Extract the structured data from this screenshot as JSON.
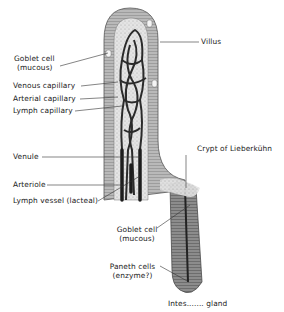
{
  "diagram": {
    "labels": {
      "villus": "Villus",
      "goblet_cell_villus": "Goblet cell",
      "goblet_cell_villus_note": "(mucous)",
      "venous_capillary": "Venous capillary",
      "arterial_capillary": "Arterial capillary",
      "lymph_capillary": "Lymph capillary",
      "venule": "Venule",
      "arteriole": "Arteriole",
      "lymph_vessel": "Lymph vessel (lacteal)",
      "crypt": "Crypt of Lieberkühn",
      "goblet_cell_crypt": "Goblet cell",
      "goblet_cell_crypt_note": "(mucous)",
      "paneth_cells": "Paneth cells",
      "paneth_cells_note": "(enzyme?)",
      "gland": "Intes....... gland"
    },
    "colors": {
      "background": "#ffffff",
      "epithelium": "#9a9a9a",
      "stroma": "#d8d8d8",
      "vessel": "#2b2b2b",
      "text": "#1a1a1a"
    }
  }
}
